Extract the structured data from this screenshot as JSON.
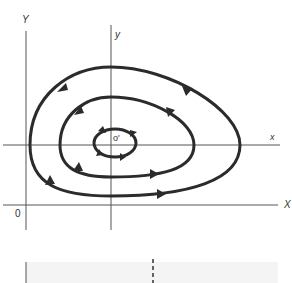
{
  "figure": {
    "type": "phase-portrait",
    "axes": {
      "global": {
        "x_label": "X",
        "y_label": "Y",
        "origin_label": "0"
      },
      "local": {
        "x_label": "x",
        "y_label": "y",
        "origin_label": "o'"
      }
    },
    "trajectories": [
      {
        "name": "outer",
        "direction": "counterclockwise",
        "arrows": 4
      },
      {
        "name": "middle",
        "direction": "counterclockwise",
        "arrows": 4
      },
      {
        "name": "inner",
        "direction": "counterclockwise",
        "arrows": 4
      }
    ],
    "colors": {
      "curve": "#2b2b2b",
      "axis": "#555555",
      "background": "#ffffff",
      "strip": "#f4f4f4"
    }
  }
}
